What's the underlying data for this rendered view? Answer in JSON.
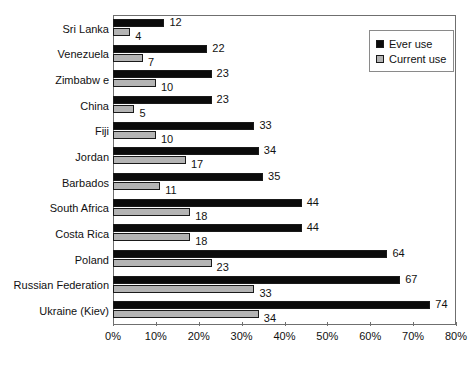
{
  "chart_data": {
    "type": "bar",
    "title": "",
    "subtitle": "",
    "xlabel": "",
    "ylabel": "",
    "orientation": "horizontal",
    "xlim": [
      0,
      80
    ],
    "xtick_step": 10,
    "grid": false,
    "legend_position": "top-right",
    "categories": [
      "Sri Lanka",
      "Venezuela",
      "Zimbabw e",
      "China",
      "Fiji",
      "Jordan",
      "Barbados",
      "South Africa",
      "Costa Rica",
      "Poland",
      "Russian Federation",
      "Ukraine (Kiev)"
    ],
    "series": [
      {
        "name": "Ever use",
        "color": "#0b0b0b",
        "values": [
          12,
          22,
          23,
          23,
          33,
          34,
          35,
          44,
          44,
          64,
          67,
          74
        ]
      },
      {
        "name": "Current use",
        "color": "#b4b4b4",
        "values": [
          4,
          7,
          10,
          5,
          10,
          17,
          11,
          18,
          18,
          23,
          33,
          34
        ]
      }
    ],
    "xticks": [
      "0%",
      "10%",
      "20%",
      "30%",
      "40%",
      "50%",
      "60%",
      "70%",
      "80%"
    ],
    "xtick_values": [
      0,
      10,
      20,
      30,
      40,
      50,
      60,
      70,
      80
    ],
    "value_labels": {
      "ever": [
        "12",
        "22",
        "23",
        "23",
        "33",
        "34",
        "35",
        "44",
        "44",
        "64",
        "67",
        "74"
      ],
      "current": [
        "4",
        "7",
        "10",
        "5",
        "10",
        "17",
        "11",
        "18",
        "18",
        "23",
        "33",
        "34"
      ]
    }
  },
  "legend": {
    "items": [
      {
        "label": "Ever use",
        "color": "#0b0b0b"
      },
      {
        "label": "Current use",
        "color": "#b4b4b4"
      }
    ]
  }
}
